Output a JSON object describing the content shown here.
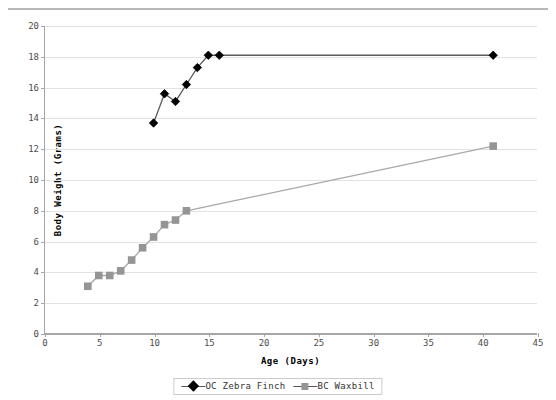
{
  "chart_data": {
    "type": "line",
    "title": "",
    "xlabel": "Age  (Days)",
    "ylabel": "Body Weight  (Grams)",
    "xlim": [
      0,
      45
    ],
    "ylim": [
      0,
      20
    ],
    "xticks": [
      0,
      5,
      10,
      15,
      20,
      25,
      30,
      35,
      40,
      45
    ],
    "yticks": [
      0,
      2,
      4,
      6,
      8,
      10,
      12,
      14,
      16,
      18,
      20
    ],
    "grid": "horizontal",
    "legend_position": "bottom-center",
    "series": [
      {
        "name": "OC Zebra Finch",
        "marker": "diamond",
        "color": "#000000",
        "line_color": "#5a5a5a",
        "x": [
          10,
          11,
          12,
          13,
          14,
          15,
          16,
          41
        ],
        "y": [
          13.7,
          15.6,
          15.1,
          16.2,
          17.3,
          18.1,
          18.1,
          18.1
        ]
      },
      {
        "name": "BC Waxbill",
        "marker": "square",
        "color": "#959595",
        "line_color": "#a8a8a8",
        "x": [
          4,
          5,
          6,
          7,
          8,
          9,
          10,
          11,
          12,
          13,
          41
        ],
        "y": [
          3.1,
          3.8,
          3.8,
          4.1,
          4.8,
          5.6,
          6.3,
          7.1,
          7.4,
          8.0,
          12.2
        ]
      }
    ]
  },
  "legend": {
    "entries": [
      {
        "label": "OC Zebra Finch",
        "marker": "diamond-marker"
      },
      {
        "label": "BC Waxbill",
        "marker": "square-marker"
      }
    ]
  },
  "axis_titles": {
    "x": "Age  (Days)",
    "y": "Body Weight  (Grams)"
  },
  "colors": {
    "finch": "#000000",
    "waxbill": "#959595",
    "grid": "#e2e2e2",
    "axis": "#a6a6a6",
    "tick_text": "#4d4d4d"
  }
}
